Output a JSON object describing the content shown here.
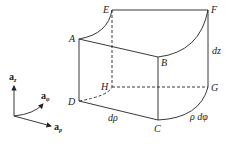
{
  "figure": {
    "type": "differential-volume-cylindrical",
    "vertices": {
      "A": "A",
      "B": "B",
      "C": "C",
      "D": "D",
      "E": "E",
      "F": "F",
      "G": "G",
      "H": "H"
    },
    "dimension_labels": {
      "dz": "dz",
      "drho": "dρ",
      "rho_dphi": "ρ dφ"
    },
    "axes": {
      "z": {
        "base": "a",
        "sub": "z"
      },
      "phi": {
        "base": "a",
        "sub": "φ"
      },
      "rho": {
        "base": "a",
        "sub": "ρ"
      }
    },
    "colors": {
      "stroke": "#222222",
      "background": "#ffffff"
    }
  }
}
